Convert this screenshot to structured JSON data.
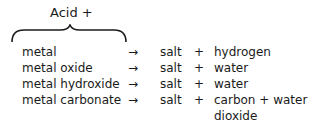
{
  "header": {
    "title": "Acid +"
  },
  "reactions": [
    {
      "reactant": "metal",
      "arrow": "→",
      "salt": "salt",
      "plus": "+",
      "products": "hydrogen"
    },
    {
      "reactant": "metal oxide",
      "arrow": "→",
      "salt": "salt",
      "plus": "+",
      "products": "water"
    },
    {
      "reactant": "metal hydroxide",
      "arrow": "→",
      "salt": "salt",
      "plus": "+",
      "products": "water"
    },
    {
      "reactant": "metal carbonate",
      "arrow": "→",
      "salt": "salt",
      "plus": "+",
      "products": "carbon + water",
      "products_line2": "dioxide"
    }
  ]
}
